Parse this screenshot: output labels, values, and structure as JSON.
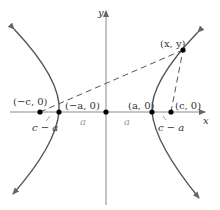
{
  "diagram": {
    "type": "hyperbola-foci-distance",
    "colors": {
      "axis": "#8a8a8a",
      "curve": "#555555",
      "dashed": "#555555",
      "point": "#000000",
      "text": "#333333",
      "faint_text": "#9a9a9a"
    },
    "axes": {
      "x_label": "x",
      "y_label": "y"
    },
    "points": {
      "neg_c": {
        "label": "(−c, 0)"
      },
      "neg_a": {
        "label": "(−a, 0)"
      },
      "origin": {
        "label": ""
      },
      "pos_a": {
        "label": "(a, 0)"
      },
      "pos_c": {
        "label": "(c, 0)"
      },
      "xy": {
        "label": "(x, y)"
      }
    },
    "segment_labels": {
      "left_c_minus_a": "c − a",
      "right_c_minus_a": "c − a",
      "left_a": "a",
      "right_a": "a"
    }
  }
}
